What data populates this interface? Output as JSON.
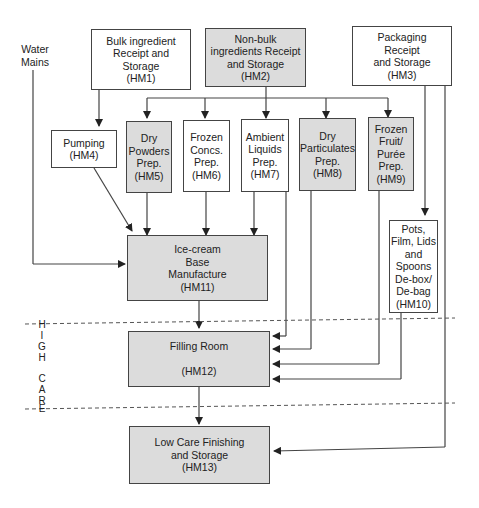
{
  "diagram": {
    "water_mains_label": "Water\nMains",
    "zone": {
      "letters": [
        "H",
        "I",
        "G",
        "H",
        "",
        "C",
        "A",
        "R",
        "E"
      ],
      "name": "HIGH CARE"
    },
    "nodes": {
      "hm1": {
        "text": "Bulk ingredient\nReceipt and\nStorage\n(HM1)"
      },
      "hm2": {
        "text": "Non-bulk\ningredients Receipt\nand Storage\n(HM2)"
      },
      "hm3": {
        "text": "Packaging\nReceipt\nand Storage\n(HM3)"
      },
      "hm4": {
        "text": "Pumping\n(HM4)"
      },
      "hm5": {
        "text": "Dry\nPowders\nPrep.\n(HM5)"
      },
      "hm6": {
        "text": "Frozen\nConcs.\nPrep.\n(HM6)"
      },
      "hm7": {
        "text": "Ambient\nLiquids\nPrep.\n(HM7)"
      },
      "hm8": {
        "text": "Dry\nParticulates\nPrep.\n(HM8)"
      },
      "hm9": {
        "text": "Frozen\nFruit/\nPurée\nPrep.\n(HM9)"
      },
      "hm10": {
        "text": "Pots,\nFilm, Lids\nand\nSpoons\nDe-box/\nDe-bag\n(HM10)"
      },
      "hm11": {
        "text": "Ice-cream\nBase\nManufacture\n(HM11)"
      },
      "hm12": {
        "text": "Filling Room\n\n(HM12)"
      },
      "hm13": {
        "text": "Low Care Finishing\nand Storage\n(HM13)"
      }
    },
    "edges": [
      [
        "HM1",
        "HM4"
      ],
      [
        "HM2",
        "HM5"
      ],
      [
        "HM2",
        "HM6"
      ],
      [
        "HM2",
        "HM7"
      ],
      [
        "HM2",
        "HM8"
      ],
      [
        "HM2",
        "HM9"
      ],
      [
        "HM3",
        "HM10"
      ],
      [
        "HM3",
        "HM13"
      ],
      [
        "Water Mains",
        "HM11"
      ],
      [
        "HM4",
        "HM11"
      ],
      [
        "HM5",
        "HM11"
      ],
      [
        "HM6",
        "HM11"
      ],
      [
        "HM7",
        "HM11"
      ],
      [
        "HM11",
        "HM12"
      ],
      [
        "HM7",
        "HM12"
      ],
      [
        "HM8",
        "HM12"
      ],
      [
        "HM9",
        "HM12"
      ],
      [
        "HM10",
        "HM12"
      ],
      [
        "HM12",
        "HM13"
      ]
    ]
  }
}
